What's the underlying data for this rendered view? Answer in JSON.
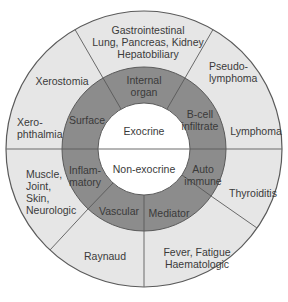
{
  "diagram": {
    "colors": {
      "outer_ring": "#e6e6e6",
      "middle_ring": "#8c8c8c",
      "center": "#ffffff",
      "stroke": "#5a5a5a"
    },
    "center": {
      "top": "Exocrine",
      "bottom": "Non-exocrine"
    },
    "middle_ring": [
      {
        "label": "Surface"
      },
      {
        "label": "Internal\norgan"
      },
      {
        "label": "B-cell\ninfiltrate"
      },
      {
        "label": "Auto\nimmune"
      },
      {
        "label": "Mediator"
      },
      {
        "label": "Vascular"
      },
      {
        "label": "Inflam-\nmatory"
      }
    ],
    "outer_ring": [
      {
        "label": "Xerostomia"
      },
      {
        "label": "Xero-\nphthalmia"
      },
      {
        "label": "Gastrointestinal\nLung, Pancreas, Kidney\nHepatobiliary"
      },
      {
        "label": "Pseudo-\nlymphoma"
      },
      {
        "label": "Lymphoma"
      },
      {
        "label": "Thyroiditis"
      },
      {
        "label": "Fever, Fatigue\nHaematologic"
      },
      {
        "label": "Raynaud"
      },
      {
        "label": "Muscle,\nJoint,\nSkin,\nNeurologic"
      }
    ]
  }
}
